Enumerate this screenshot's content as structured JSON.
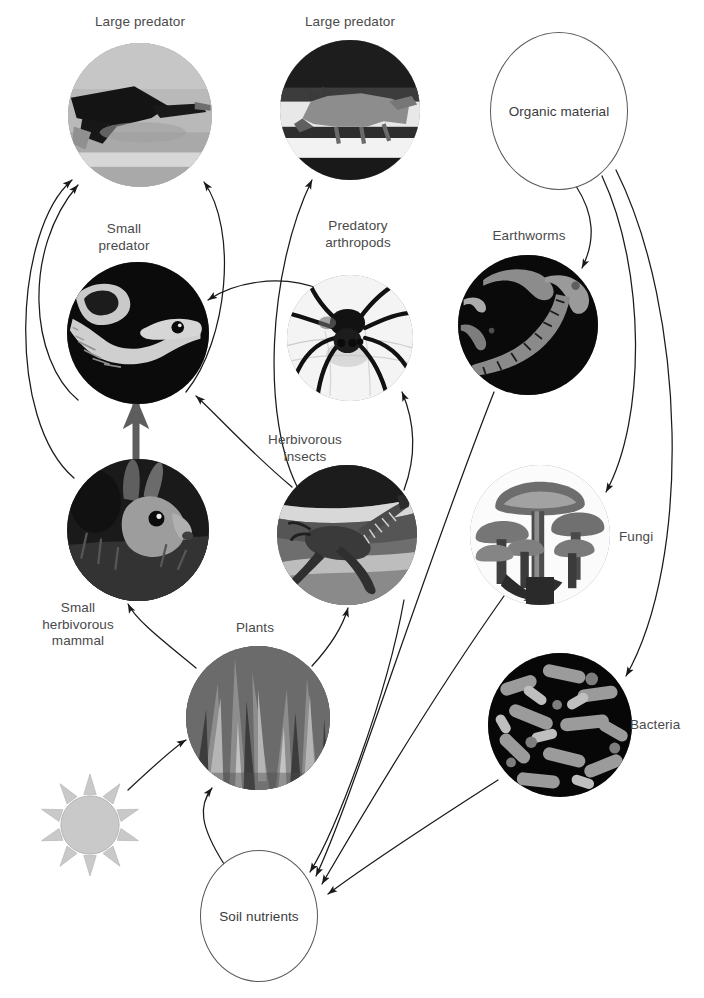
{
  "diagram": {
    "width": 704,
    "height": 998,
    "background": "#ffffff",
    "line_color": "#1a1a1a",
    "text_color": "#4a4a4a",
    "ellipse_stroke": "#5a5a5a",
    "sun_color": "#c9c9c9"
  },
  "nodes": [
    {
      "id": "large-predator-bird",
      "label": "Large predator",
      "kind": "photo",
      "subject": "eagle-photo",
      "cx": 140,
      "cy": 115,
      "r": 72,
      "label_x": 140,
      "label_y": 14,
      "label_align": "center"
    },
    {
      "id": "large-predator-wolf",
      "label": "Large predator",
      "kind": "photo",
      "subject": "wolf-photo",
      "cx": 350,
      "cy": 110,
      "r": 70,
      "label_x": 350,
      "label_y": 14,
      "label_align": "center"
    },
    {
      "id": "organic-material",
      "label": "Organic material",
      "kind": "ellipse",
      "cx": 558,
      "cy": 110,
      "rx": 68,
      "ry": 78
    },
    {
      "id": "small-predator",
      "label": "Small\npredator",
      "kind": "photo",
      "subject": "snake-photo",
      "cx": 138,
      "cy": 333,
      "r": 71,
      "label_x": 124,
      "label_y": 221,
      "label_align": "center"
    },
    {
      "id": "predatory-arthropods",
      "label": "Predatory\narthropods",
      "kind": "photo",
      "subject": "spider-photo",
      "cx": 350,
      "cy": 338,
      "r": 63,
      "label_x": 358,
      "label_y": 218,
      "label_align": "center"
    },
    {
      "id": "earthworms",
      "label": "Earthworms",
      "kind": "photo",
      "subject": "earthworm-photo",
      "cx": 528,
      "cy": 325,
      "r": 70,
      "label_x": 529,
      "label_y": 228,
      "label_align": "center"
    },
    {
      "id": "small-herbivorous-mammal",
      "label": "Small\nherbivorous\nmammal",
      "kind": "photo",
      "subject": "rabbit-photo",
      "cx": 138,
      "cy": 530,
      "r": 71,
      "label_x": 78,
      "label_y": 600,
      "label_align": "center"
    },
    {
      "id": "herbivorous-insects",
      "label": "Herbivorous\ninsects",
      "kind": "photo",
      "subject": "grasshopper-photo",
      "cx": 347,
      "cy": 535,
      "r": 70,
      "label_x": 305,
      "label_y": 432,
      "label_align": "center"
    },
    {
      "id": "fungi",
      "label": "Fungi",
      "kind": "photo",
      "subject": "mushroom-photo",
      "cx": 540,
      "cy": 535,
      "r": 70,
      "label_x": 619,
      "label_y": 529,
      "label_align": "left"
    },
    {
      "id": "plants",
      "label": "Plants",
      "kind": "photo",
      "subject": "grass-photo",
      "cx": 258,
      "cy": 718,
      "r": 72,
      "label_x": 255,
      "label_y": 620,
      "label_align": "center"
    },
    {
      "id": "bacteria",
      "label": "Bacteria",
      "kind": "photo",
      "subject": "bacteria-photo",
      "cx": 560,
      "cy": 725,
      "r": 72,
      "label_x": 630,
      "label_y": 717,
      "label_align": "left"
    },
    {
      "id": "soil-nutrients",
      "label": "Soil nutrients",
      "kind": "ellipse",
      "cx": 258,
      "cy": 915,
      "rx": 58,
      "ry": 65
    },
    {
      "id": "sun",
      "label": "",
      "kind": "sun",
      "cx": 90,
      "cy": 825,
      "r": 52
    }
  ],
  "arrows": [
    {
      "from": "small-predator",
      "to": "large-predator-bird",
      "path": "M 78 400 C 30 360 22 250 78 185"
    },
    {
      "from": "small-herbivorous-mammal",
      "to": "large-predator-bird",
      "path": "M 74 478 C 6 420 14 230 72 180"
    },
    {
      "from": "small-predator",
      "to": "large-predator-bird",
      "path": "M 186 392 C 228 340 238 230 204 182"
    },
    {
      "from": "herbivorous-insects",
      "to": "large-predator-wolf",
      "path": "M 300 492 C 260 420 268 270 312 180"
    },
    {
      "from": "predatory-arthropods",
      "to": "small-predator",
      "path": "M 322 290 C 278 272 232 284 208 300"
    },
    {
      "from": "herbivorous-insects",
      "to": "small-predator",
      "path": "M 292 487 C 250 452 216 414 196 396"
    },
    {
      "from": "small-herbivorous-mammal",
      "to": "small-predator",
      "path": "M 136 462 L 136 404",
      "thick": true
    },
    {
      "from": "herbivorous-insects",
      "to": "predatory-arthropods",
      "path": "M 404 490 C 418 452 414 420 402 392"
    },
    {
      "from": "organic-material",
      "to": "earthworms",
      "path": "M 576 186 C 594 214 596 240 582 268"
    },
    {
      "from": "organic-material",
      "to": "fungi",
      "path": "M 602 176 C 646 270 646 420 606 492"
    },
    {
      "from": "organic-material",
      "to": "bacteria",
      "path": "M 616 170 C 686 310 692 560 626 676"
    },
    {
      "from": "plants",
      "to": "small-herbivorous-mammal",
      "path": "M 196 668 C 162 640 136 620 128 604"
    },
    {
      "from": "plants",
      "to": "herbivorous-insects",
      "path": "M 312 666 C 336 640 344 622 348 608"
    },
    {
      "from": "sun",
      "to": "plants",
      "path": "M 128 790 C 158 762 176 746 186 740"
    },
    {
      "from": "soil-nutrients",
      "to": "plants",
      "path": "M 224 864 C 200 826 198 806 212 788"
    },
    {
      "from": "earthworms",
      "to": "soil-nutrients",
      "path": "M 494 392 C 420 580 352 800 316 876"
    },
    {
      "from": "fungi",
      "to": "soil-nutrients",
      "path": "M 504 596 C 430 700 350 836 322 884"
    },
    {
      "from": "bacteria",
      "to": "soil-nutrients",
      "path": "M 498 780 C 420 830 352 876 328 894"
    },
    {
      "from": "herbivorous-insects",
      "to": "soil-nutrients",
      "path": "M 404 600 C 386 700 336 830 310 872"
    }
  ]
}
